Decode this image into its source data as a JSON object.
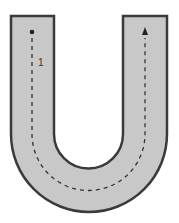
{
  "diagram": {
    "type": "u-shaped track",
    "track_fill": "#c8c8c8",
    "track_stroke": "#3a3a3a",
    "path_color": "#333333",
    "start_marker": "dot",
    "end_marker": "arrow-up",
    "segment_label": "1"
  }
}
